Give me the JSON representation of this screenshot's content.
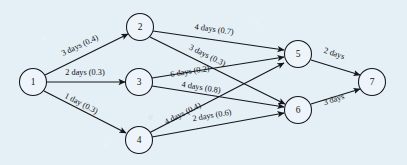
{
  "figure": {
    "kind": "activity-network-diagram",
    "background_color": "#e4eff6",
    "ink_color": "#15171a",
    "node_fill": "#eef5fa",
    "width": 407,
    "height": 165
  },
  "nodes": [
    {
      "id": "1",
      "label": "1",
      "cx": 33,
      "cy": 82,
      "r": 13.5
    },
    {
      "id": "2",
      "label": "2",
      "cx": 140,
      "cy": 27,
      "r": 13.5
    },
    {
      "id": "3",
      "label": "3",
      "cx": 139,
      "cy": 82,
      "r": 13.5
    },
    {
      "id": "4",
      "label": "4",
      "cx": 139,
      "cy": 140,
      "r": 13.5
    },
    {
      "id": "5",
      "label": "5",
      "cx": 298,
      "cy": 54,
      "r": 13.5
    },
    {
      "id": "6",
      "label": "6",
      "cx": 298,
      "cy": 110,
      "r": 13.5
    },
    {
      "id": "7",
      "label": "7",
      "cx": 372,
      "cy": 82,
      "r": 13.5
    }
  ],
  "edges": [
    {
      "id": "e12",
      "from": "1",
      "to": "2",
      "label": "3 days (0.4)",
      "duration": "3 days",
      "probability": "0.4",
      "x1": 45,
      "y1": 75,
      "x2": 128,
      "y2": 34,
      "lx": 80,
      "ly": 46,
      "rot": -25
    },
    {
      "id": "e13",
      "from": "1",
      "to": "3",
      "label": "2 days (0.3)",
      "duration": "2 days",
      "probability": "0.3",
      "x1": 47,
      "y1": 82,
      "x2": 125,
      "y2": 82,
      "lx": 85,
      "ly": 73,
      "rot": 0
    },
    {
      "id": "e14",
      "from": "1",
      "to": "4",
      "label": "1 day (0.3)",
      "duration": "1 day",
      "probability": "0.3",
      "x1": 44,
      "y1": 91,
      "x2": 126,
      "y2": 133,
      "lx": 81,
      "ly": 104,
      "rot": 27
    },
    {
      "id": "e25",
      "from": "2",
      "to": "5",
      "label": "4 days (0.7)",
      "duration": "4 days",
      "probability": "0.7",
      "x1": 153,
      "y1": 31,
      "x2": 284,
      "y2": 50,
      "lx": 214,
      "ly": 30,
      "rot": 8
    },
    {
      "id": "e26",
      "from": "2",
      "to": "6",
      "label": "3 days (0.3)",
      "duration": "3 days",
      "probability": "0.3",
      "x1": 150,
      "y1": 37,
      "x2": 285,
      "y2": 104,
      "lx": 207,
      "ly": 56,
      "rot": 26
    },
    {
      "id": "e35",
      "from": "3",
      "to": "5",
      "label": "6 days (0.2)",
      "duration": "6 days",
      "probability": "0.2",
      "x1": 152,
      "y1": 78,
      "x2": 284,
      "y2": 57,
      "lx": 190,
      "ly": 72,
      "rot": -9
    },
    {
      "id": "e36",
      "from": "3",
      "to": "6",
      "label": "4 days (0.8)",
      "duration": "4 days",
      "probability": "0.8",
      "x1": 152,
      "y1": 86,
      "x2": 284,
      "y2": 107,
      "lx": 201,
      "ly": 88,
      "rot": 9
    },
    {
      "id": "e45",
      "from": "4",
      "to": "5",
      "label": "4 days (0.4)",
      "duration": "4 days",
      "probability": "0.4",
      "x1": 149,
      "y1": 133,
      "x2": 284,
      "y2": 63,
      "lx": 183,
      "ly": 114,
      "rot": -27
    },
    {
      "id": "e46",
      "from": "4",
      "to": "6",
      "label": "2 days (0.6)",
      "duration": "2 days",
      "probability": "0.6",
      "x1": 152,
      "y1": 137,
      "x2": 284,
      "y2": 113,
      "lx": 212,
      "ly": 116,
      "rot": -10
    },
    {
      "id": "e57",
      "from": "5",
      "to": "7",
      "label": "2 days",
      "duration": "2 days",
      "probability": "",
      "x1": 311,
      "y1": 60,
      "x2": 360,
      "y2": 75,
      "lx": 334,
      "ly": 54,
      "rot": 18
    },
    {
      "id": "e67",
      "from": "6",
      "to": "7",
      "label": "3 days",
      "duration": "3 days",
      "probability": "",
      "x1": 311,
      "y1": 104,
      "x2": 360,
      "y2": 89,
      "lx": 334,
      "ly": 100,
      "rot": -18
    }
  ]
}
